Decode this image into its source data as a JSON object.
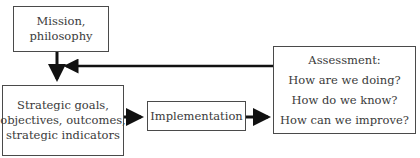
{
  "diagram": {
    "nodes": {
      "mission": {
        "lines": [
          "Mission,",
          "philosophy"
        ]
      },
      "strategic": {
        "lines": [
          "Strategic goals,",
          "objectives, outcomes,",
          "strategic indicators"
        ]
      },
      "implementation": {
        "lines": [
          "Implementation"
        ]
      },
      "assessment": {
        "lines": [
          "Assessment:",
          "How are we doing?",
          "How do we know?",
          "How can we improve?"
        ]
      }
    },
    "edges": [
      {
        "from": "mission",
        "to": "strategic"
      },
      {
        "from": "strategic",
        "to": "implementation"
      },
      {
        "from": "implementation",
        "to": "assessment"
      },
      {
        "from": "assessment",
        "to": "strategic",
        "type": "feedback"
      }
    ],
    "colors": {
      "border": "#4a4a4a",
      "arrow": "#111111",
      "text": "#3a3a3a"
    }
  }
}
